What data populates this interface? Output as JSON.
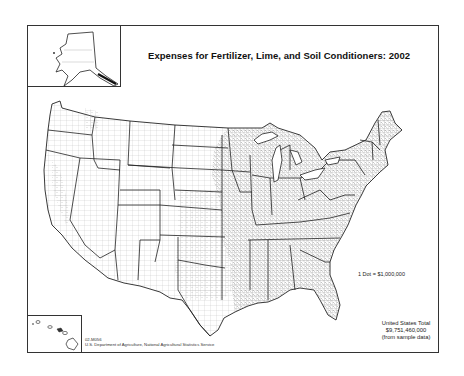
{
  "map": {
    "title": "Expenses for Fertilizer, Lime, and Soil Conditioners:  2002",
    "type": "dot-density",
    "region": "United States (contiguous, with Alaska and Hawaii insets)",
    "legend": {
      "dot_value": "1 Dot = $1,000,000"
    },
    "summary": {
      "label": "United States Total",
      "value": "$9,751,460,000",
      "note": "(from sample data)"
    },
    "credit": {
      "map_id": "02-M056",
      "source": "U.S. Department of Agriculture, National Agricultural Statistics Service"
    },
    "insets": [
      "Alaska",
      "Hawaii"
    ],
    "colors": {
      "background": "#ffffff",
      "state_border": "#222222",
      "county_border": "#9a9a9a",
      "dots": "#111111"
    }
  }
}
